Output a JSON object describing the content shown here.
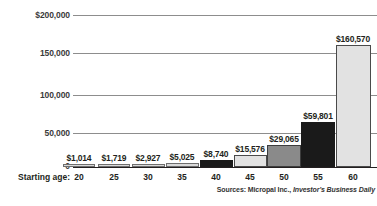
{
  "chart_data": {
    "type": "bar",
    "title": "",
    "subtitle": "",
    "xlabel": "Starting age:",
    "ylabel": "",
    "categories": [
      "20",
      "25",
      "30",
      "35",
      "40",
      "45",
      "50",
      "55",
      "60"
    ],
    "values": [
      1014,
      1719,
      2927,
      5025,
      8740,
      15576,
      29065,
      59801,
      160570
    ],
    "value_labels": [
      "$1,014",
      "$1,719",
      "$2,927",
      "$5,025",
      "$8,740",
      "$15,576",
      "$29,065",
      "$59,801",
      "$160,570"
    ],
    "ylim": [
      0,
      200000
    ],
    "yticks": [
      0,
      50000,
      100000,
      150000,
      200000
    ],
    "ytick_labels": [
      "0",
      "50,000",
      "100,000",
      "150,000",
      "$200,000"
    ],
    "grid": true,
    "legend": "none",
    "bar_styles": [
      "light",
      "light",
      "light",
      "light",
      "dark",
      "light",
      "mid",
      "dark",
      "light"
    ],
    "annotations": [
      "Sources: Micropal Inc., Investor's Business Daily"
    ]
  },
  "axis": {
    "y_top_label": "$200,000",
    "y_150_label": "150,000",
    "y_100_label": "100,000",
    "y_50_label": "50,000",
    "y_zero_label": "0",
    "x_axis_title": "Starting age:"
  },
  "source": {
    "prefix": "Sources: Micropal Inc., ",
    "italic_part": "Investor's Business Daily"
  },
  "colors": {
    "light_bar": "#e2e2e2",
    "mid_bar": "#8a8a8a",
    "dark_bar": "#1a1a1a",
    "gridline": "#8d8d8d",
    "text": "#231f20"
  }
}
